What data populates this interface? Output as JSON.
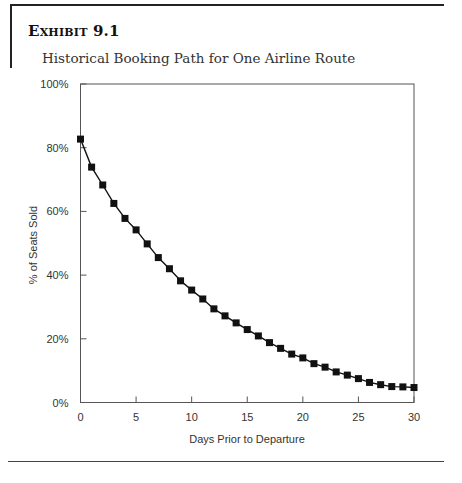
{
  "exhibit": {
    "label": "Exhibit 9.1",
    "subtitle": "Historical Booking Path for One Airline Route"
  },
  "chart_data": {
    "type": "line",
    "title": "Historical Booking Path for One Airline Route",
    "xlabel": "Days Prior to Departure",
    "ylabel": "% of Seats Sold",
    "xlim": [
      0,
      30
    ],
    "ylim": [
      0,
      100
    ],
    "x_ticks": [
      "0",
      "5",
      "10",
      "15",
      "20",
      "25",
      "30"
    ],
    "y_ticks": [
      "0%",
      "20%",
      "40%",
      "60%",
      "80%",
      "100%"
    ],
    "grid": false,
    "legend": null,
    "marker": "square",
    "series": [
      {
        "name": "% of Seats Sold",
        "x": [
          0,
          1,
          2,
          3,
          4,
          5,
          6,
          7,
          8,
          9,
          10,
          11,
          12,
          13,
          14,
          15,
          16,
          17,
          18,
          19,
          20,
          21,
          22,
          23,
          24,
          25,
          26,
          27,
          28,
          29,
          30
        ],
        "values": [
          82.7,
          73.9,
          68.3,
          62.5,
          57.8,
          54.2,
          49.8,
          45.5,
          42.0,
          38.2,
          35.3,
          32.5,
          29.4,
          27.2,
          25.0,
          22.9,
          20.9,
          18.8,
          17.0,
          15.2,
          14.0,
          12.2,
          11.1,
          9.6,
          8.6,
          7.5,
          6.3,
          5.6,
          5.0,
          4.9,
          4.7
        ]
      }
    ]
  },
  "colors": {
    "line": "#111111",
    "axis": "#555555",
    "text": "#333333"
  }
}
